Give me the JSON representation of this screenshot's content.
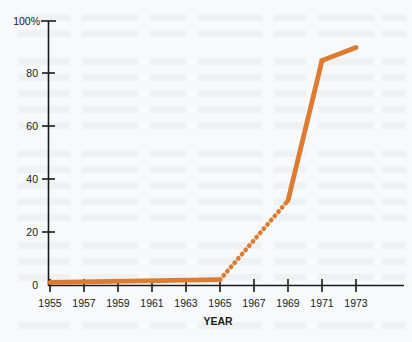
{
  "chart_data": {
    "type": "line",
    "title": "",
    "xlabel": "YEAR",
    "ylabel": "",
    "x": [
      1955,
      1957,
      1959,
      1961,
      1963,
      1965,
      1967,
      1969,
      1971,
      1973
    ],
    "categories": [
      "1955",
      "1957",
      "1959",
      "1961",
      "1963",
      "1965",
      "1967",
      "1969",
      "1971",
      "1973"
    ],
    "series": [
      {
        "name": "adoption",
        "values": [
          1,
          1,
          1,
          1,
          1,
          2,
          17,
          32,
          85,
          90
        ],
        "color": "#dd7c30",
        "segments": [
          {
            "style": "solid",
            "from_x": 1955,
            "to_x": 1965,
            "from_y": 1,
            "to_y": 2
          },
          {
            "style": "dotted",
            "from_x": 1965,
            "to_x": 1969,
            "from_y": 2,
            "to_y": 32
          },
          {
            "style": "solid",
            "from_x": 1969,
            "to_x": 1971,
            "from_y": 32,
            "to_y": 85
          },
          {
            "style": "solid",
            "from_x": 1971,
            "to_x": 1973,
            "from_y": 85,
            "to_y": 90
          }
        ]
      }
    ],
    "xlim": [
      1955,
      1973
    ],
    "ylim": [
      0,
      100
    ],
    "xticks": [
      "1955",
      "1957",
      "1959",
      "1961",
      "1963",
      "1965",
      "1967",
      "1969",
      "1971",
      "1973"
    ],
    "yticks": [
      "0",
      "20",
      "40",
      "60",
      "80",
      "100%"
    ],
    "ytick_values": [
      0,
      20,
      40,
      60,
      80,
      100
    ],
    "grid": false,
    "legend": "none",
    "background_color": "#f7f9fb",
    "axis_color": "#1a1a1a"
  },
  "axes": {
    "y_top_label": "100%",
    "y_labels": [
      "100%",
      "80",
      "60",
      "40",
      "20",
      "0"
    ],
    "x_labels": [
      "1955",
      "1957",
      "1959",
      "1961",
      "1963",
      "1965",
      "1967",
      "1969",
      "1971",
      "1973"
    ],
    "x_axis_title": "YEAR"
  }
}
